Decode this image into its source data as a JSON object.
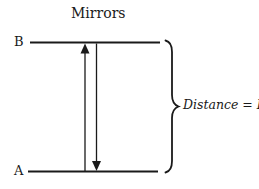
{
  "diagram": {
    "title": "Mirrors",
    "labels": {
      "top_mirror": "B",
      "bottom_mirror": "A"
    },
    "annotation": {
      "distance_label": "Distance = L"
    },
    "colors": {
      "ink": "#1a1a1a",
      "background": "#ffffff"
    }
  }
}
